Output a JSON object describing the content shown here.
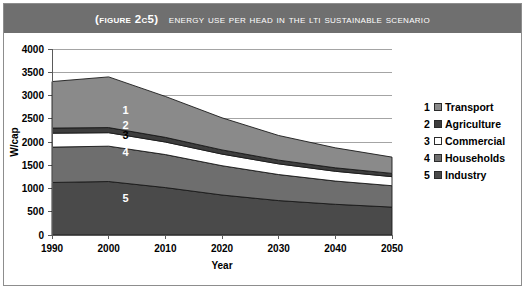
{
  "figure": {
    "label": "(Figure 2C5)",
    "title": "Energy use per head in the LTI sustainable scenario"
  },
  "legend": {
    "items": [
      {
        "num": "1",
        "label": "Transport",
        "color": "#8a8a8a"
      },
      {
        "num": "2",
        "label": "Agriculture",
        "color": "#3d3d3d"
      },
      {
        "num": "3",
        "label": "Commercial",
        "color": "#ffffff"
      },
      {
        "num": "4",
        "label": "Households",
        "color": "#6e6e6e"
      },
      {
        "num": "5",
        "label": "Industry",
        "color": "#4a4a4a"
      }
    ]
  },
  "chart_data": {
    "type": "area",
    "stacked": true,
    "title": "Energy use per head in the LTI sustainable scenario",
    "xlabel": "Year",
    "ylabel": "W/cap",
    "grid": true,
    "legend_position": "right",
    "x": [
      1990,
      2000,
      2010,
      2020,
      2030,
      2040,
      2050
    ],
    "xticks": [
      "1990",
      "2000",
      "2010",
      "2020",
      "2030",
      "2040",
      "2050"
    ],
    "xlim": [
      1990,
      2050
    ],
    "ylim": [
      0,
      4000
    ],
    "yticks": [
      "0",
      "500",
      "1000",
      "1500",
      "2000",
      "2500",
      "3000",
      "3500",
      "4000"
    ],
    "ytick_step": 500,
    "stack_order_bottom_to_top": [
      "Industry",
      "Households",
      "Commercial",
      "Agriculture",
      "Transport"
    ],
    "series": [
      {
        "name": "Industry",
        "num": "5",
        "color": "#4a4a4a",
        "values": [
          1130,
          1150,
          1020,
          860,
          740,
          660,
          600
        ]
      },
      {
        "name": "Households",
        "num": "4",
        "color": "#6e6e6e",
        "values": [
          760,
          760,
          710,
          630,
          560,
          500,
          460
        ]
      },
      {
        "name": "Commercial",
        "num": "3",
        "color": "#ffffff",
        "values": [
          300,
          290,
          270,
          250,
          230,
          210,
          195
        ]
      },
      {
        "name": "Agriculture",
        "num": "2",
        "color": "#3d3d3d",
        "values": [
          110,
          110,
          100,
          90,
          80,
          75,
          70
        ]
      },
      {
        "name": "Transport",
        "num": "1",
        "color": "#8a8a8a",
        "values": [
          1000,
          1090,
          880,
          690,
          530,
          430,
          350
        ]
      }
    ],
    "totals": [
      3300,
      3400,
      2980,
      2520,
      2140,
      1875,
      1675
    ],
    "band_label_positions": [
      {
        "num": "1",
        "x": 2003,
        "y": 2600,
        "light": true
      },
      {
        "num": "2",
        "x": 2003,
        "y": 2280,
        "light": true
      },
      {
        "num": "3",
        "x": 2003,
        "y": 2055,
        "light": false
      },
      {
        "num": "4",
        "x": 2003,
        "y": 1700,
        "light": true
      },
      {
        "num": "5",
        "x": 2003,
        "y": 700,
        "light": true
      }
    ]
  }
}
